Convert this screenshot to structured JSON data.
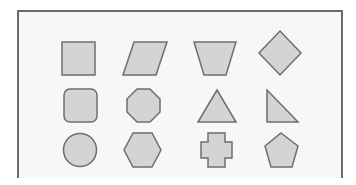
{
  "diagram": {
    "frame": {
      "border_color": "#6a6a6a",
      "background": "#f7f7f7"
    },
    "shape_style": {
      "fill": "#d4d4d4",
      "stroke": "#6e6e6e",
      "stroke_width": 1.5
    },
    "rows": [
      [
        "square",
        "parallelogram",
        "trapezoid",
        "diamond"
      ],
      [
        "rounded-square",
        "octagon",
        "triangle",
        "right-triangle"
      ],
      [
        "circle",
        "hexagon",
        "cross",
        "pentagon"
      ]
    ]
  }
}
